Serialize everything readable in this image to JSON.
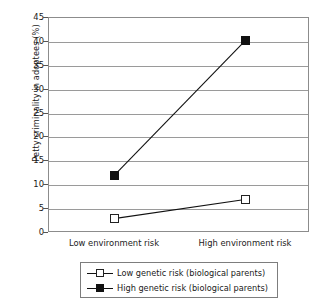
{
  "chart_data": {
    "type": "line",
    "title": "",
    "xlabel": "",
    "ylabel": "Petty criminality in adoptees (%)",
    "categories": [
      "Low environment risk",
      "High environment risk"
    ],
    "ylim": [
      0,
      45
    ],
    "yticks": [
      0,
      5,
      10,
      15,
      20,
      25,
      30,
      35,
      40,
      45
    ],
    "ytick_labels": [
      "0",
      "5",
      "10",
      "15",
      "20",
      "25",
      "30",
      "35",
      "40",
      "45"
    ],
    "grid": "horizontal",
    "legend_position": "below-center",
    "series": [
      {
        "name": "Low genetic risk (biological parents)",
        "marker": "open-square",
        "color": "#111111",
        "values": [
          2.8,
          6.8
        ]
      },
      {
        "name": "High genetic risk (biological parents)",
        "marker": "filled-square",
        "color": "#111111",
        "values": [
          11.8,
          40.0
        ]
      }
    ]
  },
  "axis": {
    "y_title": "Petty criminality in adoptees (%)",
    "y_labels": [
      "45",
      "40",
      "35",
      "30",
      "25",
      "20",
      "15",
      "10",
      "5",
      "0"
    ],
    "x_labels": [
      "Low environment risk",
      "High environment risk"
    ]
  },
  "legend": {
    "entries": [
      {
        "label": "Low genetic risk (biological parents)",
        "marker": "open-square"
      },
      {
        "label": "High genetic risk (biological parents)",
        "marker": "filled-square"
      }
    ]
  }
}
